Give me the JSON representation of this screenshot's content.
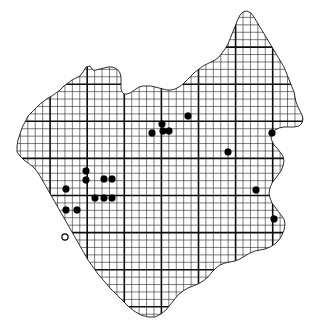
{
  "figure": {
    "name": "distribution-map",
    "type": "dot-distribution-atlas-map",
    "title": "",
    "caption": "",
    "background_color": "#ffffff",
    "ink_color": "#000000"
  },
  "chart_data": {
    "type": "scatter",
    "title": "",
    "xlabel": "",
    "ylabel": "",
    "xlim": [
      0,
      319
    ],
    "ylim": [
      0,
      332
    ],
    "grid": true,
    "legend_position": "none",
    "grid_spec": {
      "fine_cell_px": 7.42,
      "bold_every_n_cells": 5,
      "fine_color": "#2a2a2a",
      "bold_color": "#0d0d0d",
      "origin_x": 13.0,
      "origin_y": 10.0,
      "n_cols": 41,
      "n_rows": 43
    },
    "series": [
      {
        "name": "records-filled",
        "marker": "filled-circle",
        "marker_radius_px": 3.4,
        "color": "#000000",
        "count": 19,
        "points": [
          {
            "x": 188,
            "y": 116
          },
          {
            "x": 162,
            "y": 124
          },
          {
            "x": 163,
            "y": 131
          },
          {
            "x": 169,
            "y": 131
          },
          {
            "x": 152,
            "y": 133
          },
          {
            "x": 272,
            "y": 133
          },
          {
            "x": 228,
            "y": 152
          },
          {
            "x": 86,
            "y": 171
          },
          {
            "x": 86,
            "y": 180
          },
          {
            "x": 104,
            "y": 179
          },
          {
            "x": 112,
            "y": 179
          },
          {
            "x": 256,
            "y": 190
          },
          {
            "x": 66,
            "y": 189
          },
          {
            "x": 95,
            "y": 198
          },
          {
            "x": 104,
            "y": 198
          },
          {
            "x": 112,
            "y": 198
          },
          {
            "x": 66,
            "y": 210
          },
          {
            "x": 77,
            "y": 210
          },
          {
            "x": 274,
            "y": 219
          }
        ]
      },
      {
        "name": "records-open",
        "marker": "open-circle",
        "marker_radius_px": 3.1,
        "color": "#ffffff",
        "count": 1,
        "points": [
          {
            "x": 65,
            "y": 237
          }
        ]
      }
    ]
  },
  "coastline": {
    "name": "region-outline",
    "stroke": "#1a1a1a",
    "path": "M 93,70 L 90,66 L 86,67 L 83,72 L 80,76 L 76,78 L 72,80 L 68,83 L 64,86 L 60,90 L 56,93 L 52,96 L 48,98 L 44,101 L 40,104 L 36,108 L 32,112 L 28,116 L 25,122 L 22,128 L 20,134 L 18,140 L 17,146 L 17,152 L 20,156 L 24,160 L 28,163 L 32,166 L 36,170 L 40,176 L 44,183 L 48,190 L 52,197 L 56,204 L 60,211 L 64,218 L 68,225 L 72,232 L 76,239 L 80,246 L 84,253 L 88,260 L 93,267 L 98,274 L 104,281 L 110,288 L 116,294 L 122,300 L 128,306 L 134,311 L 141,315 L 148,317 L 155,317 L 161,314 L 166,310 L 170,305 L 174,300 L 178,295 L 183,291 L 188,288 L 193,286 L 198,284 L 203,281 L 208,277 L 212,272 L 216,268 L 220,265 L 225,263 L 230,262 L 235,261 L 240,259 L 245,256 L 250,253 L 255,251 L 260,250 L 265,249 L 270,247 L 275,244 L 279,240 L 282,235 L 284,230 L 285,224 L 284,219 L 281,215 L 278,211 L 275,207 L 272,203 L 270,198 L 269,193 L 270,188 L 272,183 L 275,179 L 278,175 L 281,171 L 283,166 L 284,161 L 283,156 L 280,152 L 277,148 L 274,145 L 272,141 L 271,137 L 272,133 L 275,130 L 279,128 L 284,127 L 289,127 L 294,127 L 299,126 L 302,123 L 303,119 L 302,115 L 300,111 L 298,107 L 296,102 L 295,97 L 294,92 L 292,87 L 290,82 L 288,77 L 286,72 L 284,67 L 281,62 L 278,57 L 275,52 L 272,47 L 269,42 L 266,37 L 263,32 L 260,27 L 257,22 L 254,17 L 251,13 L 247,11 L 243,12 L 240,15 L 238,19 L 236,24 L 234,29 L 232,34 L 230,39 L 228,44 L 225,49 L 222,53 L 219,57 L 215,60 L 211,62 L 207,64 L 203,66 L 199,69 L 195,72 L 191,76 L 187,80 L 183,84 L 179,87 L 175,89 L 171,90 L 167,90 L 163,89 L 159,88 L 155,87 L 151,86 L 147,86 L 143,86 L 139,87 L 136,89 L 133,91 L 130,93 L 127,94 L 124,94 L 122,92 L 121,89 L 121,85 L 121,81 L 121,77 L 120,73 L 118,70 L 115,68 L 112,67 L 108,67 L 104,68 L 100,69 L 96,70 Z"
  },
  "accessibility": {
    "alt_text": "Grid-based distribution map showing twenty record locations, nineteen as filled dots and one as an open circle."
  }
}
